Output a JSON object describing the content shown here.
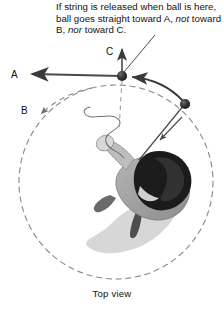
{
  "figure": {
    "type": "physics-diagram",
    "view_caption": "Top view",
    "annotation": {
      "line1": "If string is released when ball is",
      "line2": "here, ball goes straight toward",
      "line3_part1": "A, ",
      "line3_italic1": "not",
      "line3_part2": " toward B, ",
      "line3_italic2": "nor",
      "line3_part3": " toward C."
    },
    "labels": {
      "a": "A",
      "b": "B",
      "c": "C"
    },
    "elements": {
      "ball_top_name": "ball-at-release-point",
      "ball_right_name": "ball-on-string",
      "circle_name": "circular-path",
      "person_name": "person-top-view",
      "shadow_name": "person-shadow",
      "string_name": "taut-string",
      "loose_string_name": "released-string"
    },
    "colors": {
      "ink": "#111111",
      "ball": "#2e2e2e",
      "arrow": "#3a3a3a",
      "dashed_path": "#8a8a8a",
      "shadow": "#c9c9c9",
      "body_gray": "#9a9a9a",
      "hair": "#1c1c1c",
      "skin": "#d6d6d6"
    },
    "geometry": {
      "circle_center_x": 116,
      "circle_center_y": 182,
      "circle_radius": 97,
      "ball_top_x": 122,
      "ball_top_y": 76,
      "ball_right_x": 185,
      "ball_right_y": 104,
      "hand_x": 139,
      "hand_y": 160
    }
  }
}
